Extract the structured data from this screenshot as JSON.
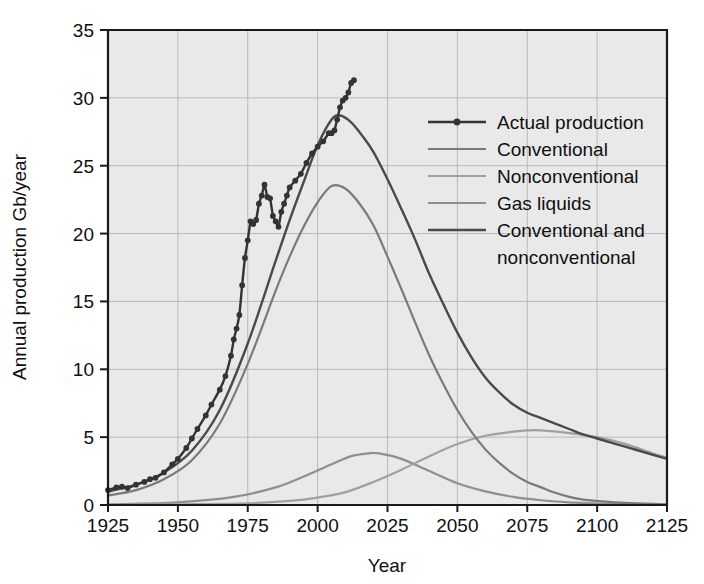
{
  "chart_data": {
    "type": "line",
    "title": "",
    "xlabel": "Year",
    "ylabel": "Annual production Gb/year",
    "xlim": [
      1925,
      2125
    ],
    "ylim": [
      0,
      35
    ],
    "xticks": [
      1925,
      1950,
      1975,
      2000,
      2025,
      2050,
      2075,
      2100,
      2125
    ],
    "yticks": [
      0,
      5,
      10,
      15,
      20,
      25,
      30,
      35
    ],
    "grid": true,
    "legend_position": "upper-right-inside",
    "series": [
      {
        "name": "Actual production",
        "color": "#333333",
        "width": 2.4,
        "markers": true,
        "x": [
          1925,
          1928,
          1930,
          1932,
          1935,
          1938,
          1940,
          1942,
          1945,
          1948,
          1950,
          1953,
          1955,
          1957,
          1960,
          1962,
          1965,
          1967,
          1969,
          1970,
          1971,
          1972,
          1973,
          1974,
          1975,
          1976,
          1977,
          1978,
          1979,
          1980,
          1981,
          1982,
          1983,
          1984,
          1985,
          1986,
          1987,
          1988,
          1989,
          1990,
          1992,
          1994,
          1996,
          1998,
          2000,
          2002,
          2004,
          2005,
          2006,
          2007,
          2008,
          2009,
          2010,
          2011,
          2012,
          2013
        ],
        "y": [
          1.1,
          1.3,
          1.35,
          1.25,
          1.5,
          1.7,
          1.9,
          2.0,
          2.4,
          3.0,
          3.4,
          4.2,
          4.9,
          5.6,
          6.6,
          7.4,
          8.5,
          9.5,
          11.0,
          12.2,
          13.0,
          14.0,
          16.2,
          18.2,
          19.5,
          20.9,
          20.7,
          21.0,
          22.2,
          22.8,
          23.6,
          22.7,
          22.6,
          21.3,
          20.9,
          20.5,
          21.6,
          22.2,
          22.8,
          23.4,
          23.9,
          24.4,
          25.2,
          25.9,
          26.4,
          26.8,
          27.4,
          27.4,
          27.6,
          28.4,
          29.3,
          29.8,
          30.0,
          30.4,
          31.1,
          31.3
        ]
      },
      {
        "name": "Conventional",
        "color": "#7a7a7a",
        "width": 2.2,
        "markers": false,
        "peak_year": 2005,
        "peak_value": 23.5,
        "x": [
          1925,
          1935,
          1945,
          1955,
          1965,
          1975,
          1985,
          1990,
          1995,
          2000,
          2005,
          2010,
          2015,
          2020,
          2025,
          2030,
          2035,
          2040,
          2045,
          2050,
          2055,
          2060,
          2065,
          2070,
          2075,
          2080,
          2085,
          2090,
          2095,
          2100,
          2110,
          2125
        ],
        "y": [
          0.7,
          1.1,
          1.9,
          3.3,
          6.0,
          10.4,
          15.8,
          18.3,
          20.5,
          22.3,
          23.5,
          23.3,
          22.2,
          20.6,
          18.3,
          15.9,
          13.4,
          11.0,
          8.9,
          7.0,
          5.4,
          4.1,
          3.1,
          2.3,
          1.7,
          1.3,
          0.9,
          0.6,
          0.4,
          0.3,
          0.15,
          0.05
        ]
      },
      {
        "name": "Nonconventional",
        "color": "#a0a0a0",
        "width": 2.2,
        "markers": false,
        "peak_year": 2080,
        "peak_value": 5.5,
        "x": [
          1925,
          1950,
          1975,
          1990,
          2000,
          2010,
          2020,
          2030,
          2040,
          2050,
          2060,
          2070,
          2075,
          2080,
          2090,
          2100,
          2110,
          2120,
          2125
        ],
        "y": [
          0.0,
          0.05,
          0.12,
          0.3,
          0.55,
          0.95,
          1.7,
          2.6,
          3.6,
          4.5,
          5.1,
          5.4,
          5.5,
          5.5,
          5.3,
          5.0,
          4.5,
          3.8,
          3.5
        ]
      },
      {
        "name": "Gas liquids",
        "color": "#8f8f8f",
        "width": 2.2,
        "markers": false,
        "peak_year": 2020,
        "peak_value": 3.8,
        "x": [
          1925,
          1950,
          1970,
          1985,
          1995,
          2005,
          2012,
          2018,
          2022,
          2030,
          2040,
          2050,
          2060,
          2070,
          2080,
          2090,
          2100,
          2125
        ],
        "y": [
          0.05,
          0.2,
          0.6,
          1.3,
          2.1,
          3.0,
          3.6,
          3.8,
          3.8,
          3.4,
          2.5,
          1.6,
          1.0,
          0.6,
          0.35,
          0.2,
          0.1,
          0.02
        ]
      },
      {
        "name": "Conventional and nonconventional",
        "color": "#4a4a4a",
        "width": 2.4,
        "markers": false,
        "peak_year": 2005,
        "peak_value": 28.7,
        "x": [
          1925,
          1935,
          1945,
          1955,
          1965,
          1975,
          1985,
          1990,
          1995,
          2000,
          2005,
          2008,
          2012,
          2016,
          2020,
          2025,
          2030,
          2035,
          2040,
          2045,
          2050,
          2055,
          2060,
          2065,
          2070,
          2075,
          2080,
          2085,
          2090,
          2095,
          2100,
          2110,
          2120,
          2125
        ],
        "y": [
          1.0,
          1.5,
          2.4,
          4.0,
          7.0,
          11.9,
          18.0,
          21.0,
          23.8,
          26.5,
          28.4,
          28.7,
          28.2,
          27.2,
          26.0,
          24.0,
          21.8,
          19.5,
          17.0,
          14.8,
          12.7,
          10.9,
          9.4,
          8.3,
          7.4,
          6.8,
          6.4,
          6.0,
          5.6,
          5.2,
          4.9,
          4.3,
          3.7,
          3.4
        ]
      }
    ]
  },
  "legend": {
    "entries": [
      {
        "label": "Actual production",
        "color": "#333333",
        "marker": true
      },
      {
        "label": "Conventional",
        "color": "#7a7a7a",
        "marker": false
      },
      {
        "label": "Nonconventional",
        "color": "#a0a0a0",
        "marker": false
      },
      {
        "label": "Gas liquids",
        "color": "#8f8f8f",
        "marker": false
      },
      {
        "label": "Conventional and",
        "color": "#4a4a4a",
        "marker": false
      },
      {
        "label": "nonconventional",
        "color": null,
        "marker": false
      }
    ]
  },
  "axes": {
    "x_title": "Year",
    "y_title": "Annual production Gb/year",
    "x_tick_labels": [
      "1925",
      "1950",
      "1975",
      "2000",
      "2025",
      "2050",
      "2075",
      "2100",
      "2125"
    ],
    "y_tick_labels": [
      "0",
      "5",
      "10",
      "15",
      "20",
      "25",
      "30",
      "35"
    ]
  },
  "colors": {
    "plot_background": "#e9e9e9",
    "page_background": "#ffffff",
    "gridline": "#b9b9b9",
    "axis": "#1a1a1a",
    "text": "#101010"
  }
}
